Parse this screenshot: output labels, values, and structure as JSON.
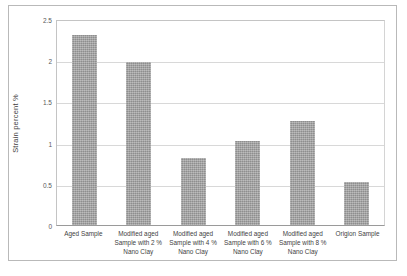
{
  "chart_data": {
    "type": "bar",
    "title": "",
    "xlabel": "",
    "ylabel": "Strain percent  %",
    "ylim": [
      0,
      2.5
    ],
    "ytick_values": [
      0,
      0.5,
      1,
      1.5,
      2,
      2.5
    ],
    "ytick_labels": [
      "0",
      "0.5",
      "1",
      "1.5",
      "2",
      "2.5"
    ],
    "grid": true,
    "legend": "none",
    "bar_color": "#a3a3a3",
    "categories": [
      "Aged Sample",
      "Modified aged Sample with 2 % Nano Clay",
      "Modified aged Sample with 4 % Nano Clay",
      "Modified aged Sample with 6 % Nano Clay",
      "Modified aged Sample with 8 % Nano Clay",
      "Origion Sample"
    ],
    "category_lines": [
      [
        "Aged Sample"
      ],
      [
        "Modified aged",
        "Sample with 2 %",
        "Nano Clay"
      ],
      [
        "Modified aged",
        "Sample with 4 %",
        "Nano Clay"
      ],
      [
        "Modified aged",
        "Sample with 6 %",
        "Nano Clay"
      ],
      [
        "Modified aged",
        "Sample with 8 %",
        "Nano Clay"
      ],
      [
        "Origion Sample"
      ]
    ],
    "values": [
      2.3,
      1.98,
      0.81,
      1.02,
      1.26,
      0.52
    ]
  }
}
